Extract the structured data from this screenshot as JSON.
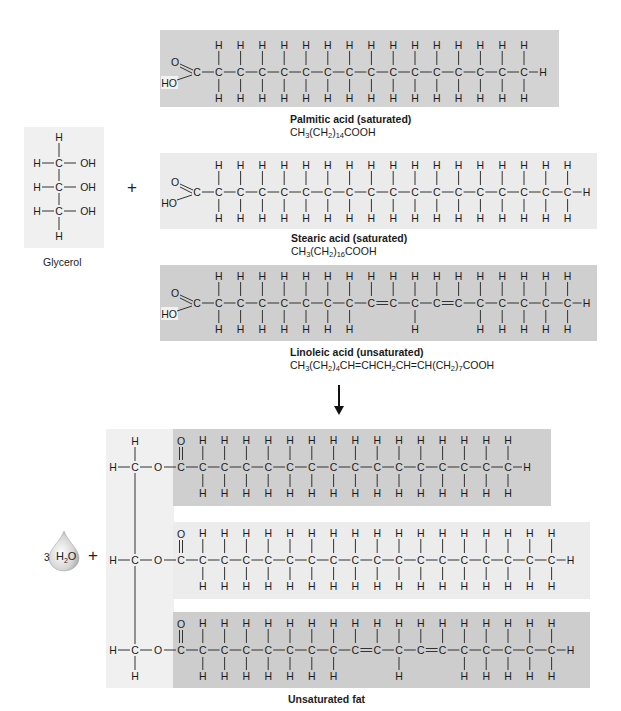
{
  "figure": {
    "reactants": {
      "glycerol": {
        "label": "Glycerol",
        "panel_color": "#f0f0f0",
        "atoms": {
          "carbon": "C",
          "hydrogen": "H",
          "hydroxyl": "OH"
        },
        "carbon_count": 3
      },
      "plus_sign": "+",
      "fatty_acids": [
        {
          "id": "palmitic",
          "name": "Palmitic acid (saturated)",
          "formula_parts": [
            "CH",
            "3",
            "(CH",
            "2",
            ")",
            "14",
            "COOH"
          ],
          "formula_text": "CH3(CH2)14COOH",
          "panel_color": "#d3d3d3",
          "carboxyl": {
            "double_o": "O",
            "hydroxyl": "HO",
            "carbon": "C"
          },
          "chain_carbons": 15,
          "double_bonds_after": [],
          "missing_top_h": [],
          "missing_bottom_h": [],
          "terminal_h": "H"
        },
        {
          "id": "stearic",
          "name": "Stearic acid (saturated)",
          "formula_parts": [
            "CH",
            "3",
            "(CH",
            "2",
            ")",
            "16",
            "COOH"
          ],
          "formula_text": "CH3(CH2)16COOH",
          "panel_color": "#ebebeb",
          "carboxyl": {
            "double_o": "O",
            "hydroxyl": "HO",
            "carbon": "C"
          },
          "chain_carbons": 17,
          "double_bonds_after": [],
          "missing_top_h": [],
          "missing_bottom_h": [],
          "terminal_h": "H"
        },
        {
          "id": "linoleic",
          "name": "Linoleic acid (unsaturated)",
          "formula_parts": [
            "CH",
            "3",
            "(CH",
            "2",
            ")",
            "4",
            "CH=CHCH",
            "2",
            "CH=CH(CH",
            "2",
            ")",
            "7",
            "COOH"
          ],
          "formula_text": "CH3(CH2)4CH=CHCH2CH=CH(CH2)7COOH",
          "panel_color": "#cfcfcf",
          "carboxyl": {
            "double_o": "O",
            "hydroxyl": "HO",
            "carbon": "C"
          },
          "chain_carbons": 17,
          "double_bonds_after": [
            8,
            11
          ],
          "missing_top_h": [],
          "missing_bottom_h": [
            8,
            9,
            11,
            12
          ],
          "terminal_h": "H"
        }
      ]
    },
    "reaction_arrow": "down-arrow",
    "products": {
      "water": {
        "coefficient": "3",
        "molecule": "H",
        "sub": "2",
        "tail": "O",
        "icon": "water-drop-icon"
      },
      "plus_sign": "+",
      "fat": {
        "label": "Unsaturated fat",
        "backbone_color": "#f0f0f0",
        "ester_atoms": {
          "carbon": "C",
          "oxygen": "O",
          "hydrogen": "H"
        },
        "chains": [
          {
            "id": "palmitoyl",
            "panel_color": "#cfcfcf",
            "chain_carbons": 15,
            "double_bonds_after": [],
            "missing_bottom_h": []
          },
          {
            "id": "stearoyl",
            "panel_color": "#ececec",
            "chain_carbons": 17,
            "double_bonds_after": [],
            "missing_bottom_h": []
          },
          {
            "id": "linoleoyl",
            "panel_color": "#cdcdcd",
            "chain_carbons": 17,
            "double_bonds_after": [
              8,
              11
            ],
            "missing_bottom_h": [
              8,
              9,
              11,
              12
            ]
          }
        ]
      }
    }
  }
}
